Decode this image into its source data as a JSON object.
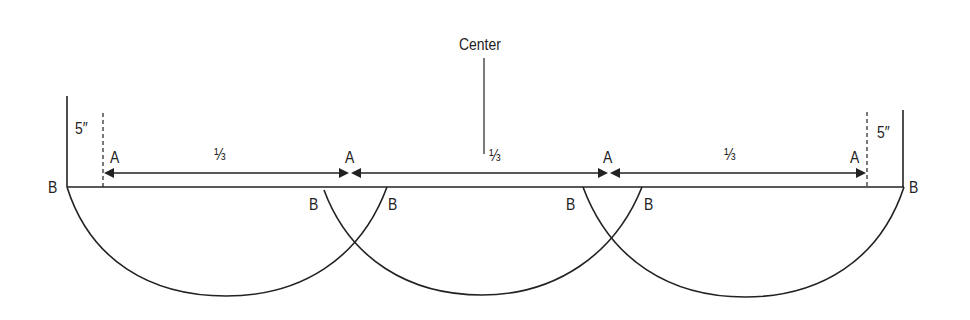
{
  "diagram": {
    "type": "layout-construction",
    "stroke_color": "#222222",
    "background": "#ffffff",
    "labels": {
      "center": "Center",
      "left_margin": "5″",
      "right_margin": "5″",
      "third_1": "⅓",
      "third_2": "⅓",
      "third_3": "⅓",
      "a_points": [
        "A",
        "A",
        "A",
        "A"
      ],
      "b_points": [
        "B",
        "B",
        "B",
        "B",
        "B",
        "B"
      ]
    },
    "segments": [
      {
        "label": "⅓",
        "from": "A",
        "to": "A"
      },
      {
        "label": "⅓",
        "from": "A",
        "to": "A"
      },
      {
        "label": "⅓",
        "from": "A",
        "to": "A"
      }
    ],
    "arcs": [
      {
        "name": "left-arc",
        "from": "B (left end)",
        "to": "B (right of first A-division)"
      },
      {
        "name": "middle-arc",
        "from": "B (left of first A-division)",
        "to": "B (right of second A-division)"
      },
      {
        "name": "right-arc",
        "from": "B (left of second A-division)",
        "to": "B (right end)"
      }
    ]
  }
}
